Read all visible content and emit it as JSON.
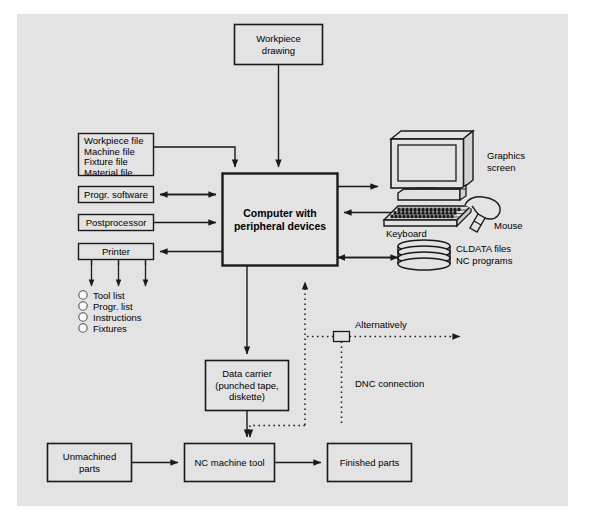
{
  "diagram": {
    "background_color": "#e3e3e3",
    "line_color": "#1a1a1a",
    "nodes": {
      "workpiece_drawing": "Workpiece\ndrawing",
      "workpiece_drawing_line1": "Workpiece",
      "workpiece_drawing_line2": "drawing",
      "files_line1": "Workpiece file",
      "files_line2": "Machine file",
      "files_line3": "Fixture file",
      "files_line4": "Material file",
      "progr_software": "Progr. software",
      "postprocessor": "Postprocessor",
      "printer": "Printer",
      "computer_line1": "Computer with",
      "computer_line2": "peripheral devices",
      "data_carrier_line1": "Data carrier",
      "data_carrier_line2": "(punched tape,",
      "data_carrier_line3": "diskette)",
      "unmachined_line1": "Unmachined",
      "unmachined_line2": "parts",
      "nc_machine_tool": "NC machine tool",
      "finished_parts": "Finished parts",
      "alternatively_box": ""
    },
    "printer_outputs": [
      "Tool list",
      "Progr. list",
      "Instructions",
      "Fixtures"
    ],
    "peripherals": {
      "graphics_screen_line1": "Graphics",
      "graphics_screen_line2": "screen",
      "keyboard": "Keyboard",
      "mouse": "Mouse",
      "storage_line1": "CLDATA files",
      "storage_line2": "NC programs"
    },
    "annotations": {
      "alternatively": "Alternatively",
      "dnc_connection": "DNC connection"
    }
  }
}
